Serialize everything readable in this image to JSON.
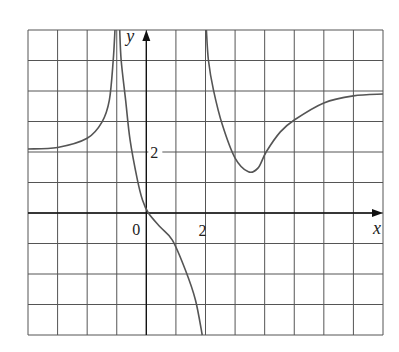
{
  "chart_data": {
    "type": "line",
    "title": "",
    "xlabel": "x",
    "ylabel": "y",
    "xlim": [
      -4,
      8
    ],
    "ylim": [
      -4,
      6
    ],
    "grid": true,
    "grid_step": 1,
    "tick_labels": {
      "origin": "0",
      "x": "2",
      "y": "2"
    },
    "vertical_asymptotes": [
      -1,
      2
    ],
    "horizontal_asymptotes": {
      "left": 2,
      "right": 4
    },
    "series": [
      {
        "name": "left-branch",
        "x": [
          -4,
          -3,
          -2,
          -1.5,
          -1.25,
          -1.12,
          -1.06
        ],
        "y": [
          2.1,
          2.15,
          2.45,
          2.98,
          3.7,
          5.0,
          6.0
        ]
      },
      {
        "name": "middle-branch",
        "x": [
          -0.9,
          -0.85,
          -0.7,
          -0.55,
          -0.3,
          -0.13,
          0.07,
          0.47,
          0.88,
          1.32,
          1.66,
          1.89
        ],
        "y": [
          6.0,
          5.0,
          3.7,
          2.4,
          1.08,
          0.43,
          0.0,
          -0.46,
          -0.89,
          -1.87,
          -2.85,
          -4.0
        ]
      },
      {
        "name": "right-branch",
        "x": [
          2.03,
          2.1,
          2.27,
          2.57,
          3.0,
          3.45,
          3.78,
          4.05,
          4.53,
          5.0,
          6.0,
          7.0,
          8.0
        ],
        "y": [
          6.0,
          5.0,
          4.03,
          2.89,
          1.8,
          1.35,
          1.48,
          2.0,
          2.66,
          3.05,
          3.61,
          3.84,
          3.9
        ]
      }
    ]
  }
}
